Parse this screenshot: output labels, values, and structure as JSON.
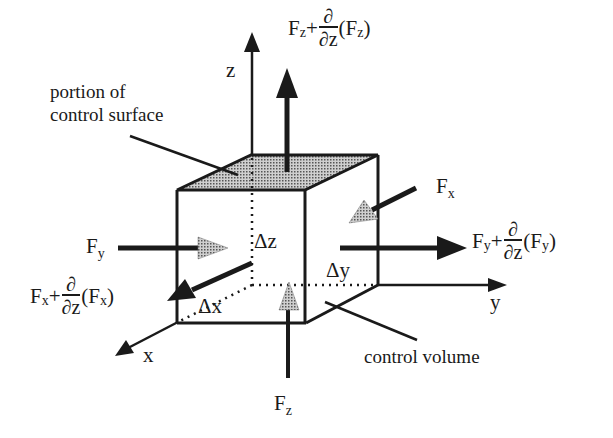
{
  "diagram": {
    "axes": {
      "x": "x",
      "y": "y",
      "z": "z"
    },
    "dimensions": {
      "dx": "Δx",
      "dy": "Δy",
      "dz": "Δz"
    },
    "annotations": {
      "surface_line1": "portion of",
      "surface_line2": "control surface",
      "volume": "control volume"
    },
    "forces": {
      "fz_top": {
        "base": "F",
        "sub": "z",
        "plus": "+",
        "num": "∂",
        "den": "∂z",
        "open": "(F",
        "arg_sub": "z",
        "close": ")"
      },
      "fy_right": {
        "base": "F",
        "sub": "y",
        "plus": "+",
        "num": "∂",
        "den": "∂z",
        "open": "(F",
        "arg_sub": "y",
        "close": ")"
      },
      "fx_front": {
        "base": "F",
        "sub": "x",
        "plus": "+",
        "num": "∂",
        "den": "∂z",
        "open": "(F",
        "arg_sub": "x",
        "close": ")"
      },
      "fy_left": {
        "base": "F",
        "sub": "y"
      },
      "fx_back": {
        "base": "F",
        "sub": "x"
      },
      "fz_bottom": {
        "base": "F",
        "sub": "z"
      }
    },
    "colors": {
      "ink": "#1a1a1a",
      "shade": "#8a8a8a",
      "background": "#ffffff"
    }
  }
}
